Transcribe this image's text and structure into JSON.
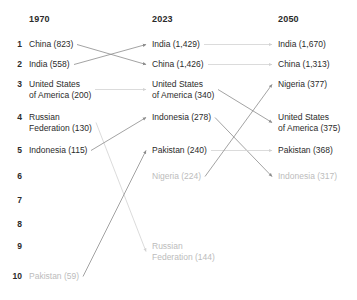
{
  "chart_data": {
    "type": "table",
    "title": "",
    "subtitle": "",
    "xlabel": "",
    "ylabel": "",
    "grid": false,
    "legend_position": "none",
    "columns": [
      "1970",
      "2023",
      "2050"
    ],
    "ranks": [
      "1",
      "2",
      "3",
      "4",
      "5",
      "6",
      "7",
      "8",
      "9",
      "10"
    ],
    "unit_note": "population in millions",
    "series": [
      {
        "name": "1970",
        "values": [
          {
            "rank": 1,
            "label": "China (823)",
            "country": "China",
            "value": 823,
            "muted": false
          },
          {
            "rank": 2,
            "label": "India (558)",
            "country": "India",
            "value": 558,
            "muted": false
          },
          {
            "rank": 3,
            "label": "United States\nof America (200)",
            "country": "United States of America",
            "value": 200,
            "muted": false
          },
          {
            "rank": 4,
            "label": "Russian\nFederation (130)",
            "country": "Russian Federation",
            "value": 130,
            "muted": false
          },
          {
            "rank": 5,
            "label": "Indonesia (115)",
            "country": "Indonesia",
            "value": 115,
            "muted": false
          },
          {
            "rank": 10,
            "label": "Pakistan (59)",
            "country": "Pakistan",
            "value": 59,
            "muted": true
          }
        ]
      },
      {
        "name": "2023",
        "values": [
          {
            "rank": 1,
            "label": "India (1,429)",
            "country": "India",
            "value": 1429,
            "muted": false
          },
          {
            "rank": 2,
            "label": "China (1,426)",
            "country": "China",
            "value": 1426,
            "muted": false
          },
          {
            "rank": 3,
            "label": "United States\nof America (340)",
            "country": "United States of America",
            "value": 340,
            "muted": false
          },
          {
            "rank": 4,
            "label": "Indonesia (278)",
            "country": "Indonesia",
            "value": 278,
            "muted": false
          },
          {
            "rank": 5,
            "label": "Pakistan (240)",
            "country": "Pakistan",
            "value": 240,
            "muted": false
          },
          {
            "rank": 6,
            "label": "Nigeria (224)",
            "country": "Nigeria",
            "value": 224,
            "muted": true
          },
          {
            "rank": 9,
            "label": "Russian\nFederation (144)",
            "country": "Russian Federation",
            "value": 144,
            "muted": true
          }
        ]
      },
      {
        "name": "2050",
        "values": [
          {
            "rank": 1,
            "label": "India (1,670)",
            "country": "India",
            "value": 1670,
            "muted": false
          },
          {
            "rank": 2,
            "label": "China (1,313)",
            "country": "China",
            "value": 1313,
            "muted": false
          },
          {
            "rank": 3,
            "label": "Nigeria (377)",
            "country": "Nigeria",
            "value": 377,
            "muted": false
          },
          {
            "rank": 4,
            "label": "United States\nof America (375)",
            "country": "United States of America",
            "value": 375,
            "muted": false
          },
          {
            "rank": 5,
            "label": "Pakistan (368)",
            "country": "Pakistan",
            "value": 368,
            "muted": false
          },
          {
            "rank": 6,
            "label": "Indonesia (317)",
            "country": "Indonesia",
            "value": 317,
            "muted": true
          }
        ]
      }
    ],
    "connections": [
      {
        "country": "China",
        "from_col": 0,
        "from_rank": 1,
        "to_col": 1,
        "to_rank": 2,
        "muted": false
      },
      {
        "country": "India",
        "from_col": 0,
        "from_rank": 2,
        "to_col": 1,
        "to_rank": 1,
        "muted": false
      },
      {
        "country": "United States of America",
        "from_col": 0,
        "from_rank": 3,
        "to_col": 1,
        "to_rank": 3,
        "muted": true
      },
      {
        "country": "Russian Federation",
        "from_col": 0,
        "from_rank": 4,
        "to_col": 1,
        "to_rank": 9,
        "muted": true
      },
      {
        "country": "Indonesia",
        "from_col": 0,
        "from_rank": 5,
        "to_col": 1,
        "to_rank": 4,
        "muted": false
      },
      {
        "country": "Pakistan",
        "from_col": 0,
        "from_rank": 10,
        "to_col": 1,
        "to_rank": 5,
        "muted": false
      },
      {
        "country": "India",
        "from_col": 1,
        "from_rank": 1,
        "to_col": 2,
        "to_rank": 1,
        "muted": true
      },
      {
        "country": "China",
        "from_col": 1,
        "from_rank": 2,
        "to_col": 2,
        "to_rank": 2,
        "muted": true
      },
      {
        "country": "United States of America",
        "from_col": 1,
        "from_rank": 3,
        "to_col": 2,
        "to_rank": 4,
        "muted": false
      },
      {
        "country": "Indonesia",
        "from_col": 1,
        "from_rank": 4,
        "to_col": 2,
        "to_rank": 6,
        "muted": false
      },
      {
        "country": "Pakistan",
        "from_col": 1,
        "from_rank": 5,
        "to_col": 2,
        "to_rank": 5,
        "muted": true
      },
      {
        "country": "Nigeria",
        "from_col": 1,
        "from_rank": 6,
        "to_col": 2,
        "to_rank": 3,
        "muted": false
      }
    ],
    "colors": {
      "text": "#2b2b2b",
      "muted_text": "#bcbcbc",
      "link": "#8c8c8c",
      "link_muted": "#d2d2d2",
      "background": "#ffffff"
    }
  }
}
